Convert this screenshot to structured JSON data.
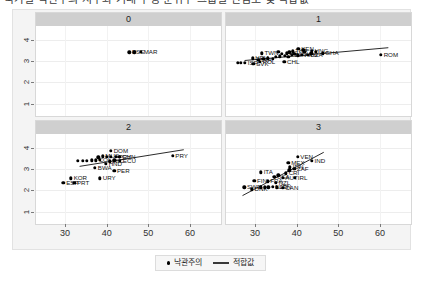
{
  "title": "국가별 낙관주의 지수와 기대 수명 분위수 그룹별 산점도 및 적합값",
  "legend": {
    "point_label": "낙관주의",
    "line_label": "적합값",
    "point_icon": "filled-circle-icon",
    "line_icon": "trend-line-icon"
  },
  "axes": {
    "xticks": [
      30,
      40,
      50,
      60
    ],
    "yticks": [
      1,
      2,
      3,
      4
    ],
    "xlim": [
      24,
      66
    ],
    "ylim": [
      0.7,
      4.45
    ],
    "xlabel": "",
    "ylabel": ""
  },
  "chart_data": {
    "type": "scatter",
    "title": "국가별 낙관주의 지수와 기대 수명 분위수 그룹별 산점도 및 적합값",
    "xlabel": "",
    "ylabel": "",
    "xlim": [
      24,
      66
    ],
    "ylim": [
      0.7,
      4.45
    ],
    "grid": true,
    "legend_position": "bottom",
    "facet_layout": "2x2",
    "facets": [
      {
        "strip": "0",
        "fit": {
          "x1": 0,
          "y1": 0,
          "x2": 0,
          "y2": 0,
          "visible": false
        },
        "points": [
          {
            "label": "PSE",
            "x": 45.4,
            "y": 3.4
          },
          {
            "label": "",
            "x": 46.6,
            "y": 3.4
          },
          {
            "label": "MAR",
            "x": 48.2,
            "y": 3.42
          }
        ]
      },
      {
        "strip": "1",
        "fit": {
          "x1": 27.5,
          "y1": 3.02,
          "x2": 62.0,
          "y2": 3.62,
          "visible": true
        },
        "points": [
          {
            "label": "TWN",
            "x": 31.6,
            "y": 3.35
          },
          {
            "label": "",
            "x": 25.8,
            "y": 2.9
          },
          {
            "label": "",
            "x": 26.6,
            "y": 2.9
          },
          {
            "label": "ISR",
            "x": 27.6,
            "y": 2.9
          },
          {
            "label": "SVK",
            "x": 29.6,
            "y": 2.86
          },
          {
            "label": "POL",
            "x": 31.2,
            "y": 2.95
          },
          {
            "label": "LVA",
            "x": 30.8,
            "y": 3.06
          },
          {
            "label": "HRV",
            "x": 29.4,
            "y": 3.13
          },
          {
            "label": "",
            "x": 32.0,
            "y": 3.1
          },
          {
            "label": "",
            "x": 33.1,
            "y": 3.12
          },
          {
            "label": "",
            "x": 34.2,
            "y": 3.11
          },
          {
            "label": "CHL",
            "x": 37.0,
            "y": 2.96
          },
          {
            "label": "",
            "x": 35.0,
            "y": 3.2
          },
          {
            "label": "",
            "x": 36.0,
            "y": 3.22
          },
          {
            "label": "",
            "x": 37.2,
            "y": 3.24
          },
          {
            "label": "",
            "x": 38.0,
            "y": 3.18
          },
          {
            "label": "BLR",
            "x": 38.8,
            "y": 3.3
          },
          {
            "label": "",
            "x": 36.4,
            "y": 3.34
          },
          {
            "label": "EGY",
            "x": 37.6,
            "y": 3.36
          },
          {
            "label": "",
            "x": 39.4,
            "y": 3.33
          },
          {
            "label": "",
            "x": 40.2,
            "y": 3.27
          },
          {
            "label": "ARG",
            "x": 41.2,
            "y": 3.3
          },
          {
            "label": "DZA",
            "x": 42.6,
            "y": 3.3
          },
          {
            "label": "",
            "x": 43.5,
            "y": 3.35
          },
          {
            "label": "",
            "x": 41.8,
            "y": 3.42
          },
          {
            "label": "THA",
            "x": 39.0,
            "y": 3.46
          },
          {
            "label": "KEN",
            "x": 40.4,
            "y": 3.56
          },
          {
            "label": "",
            "x": 41.6,
            "y": 3.52
          },
          {
            "label": "HNG",
            "x": 43.6,
            "y": 3.48
          },
          {
            "label": "",
            "x": 44.6,
            "y": 3.44
          },
          {
            "label": "GHA",
            "x": 46.2,
            "y": 3.36
          },
          {
            "label": "",
            "x": 38.2,
            "y": 3.4
          },
          {
            "label": "",
            "x": 35.6,
            "y": 3.42
          },
          {
            "label": "ROM",
            "x": 60.2,
            "y": 3.3
          }
        ]
      },
      {
        "strip": "2",
        "fit": {
          "x1": 33.5,
          "y1": 3.12,
          "x2": 58.5,
          "y2": 3.9,
          "visible": true
        },
        "points": [
          {
            "label": "ESP",
            "x": 29.6,
            "y": 2.36
          },
          {
            "label": "PRT",
            "x": 32.2,
            "y": 2.36
          },
          {
            "label": "KOR",
            "x": 31.4,
            "y": 2.56
          },
          {
            "label": "URY",
            "x": 38.4,
            "y": 2.56
          },
          {
            "label": "PER",
            "x": 41.8,
            "y": 2.92
          },
          {
            "label": "BWA",
            "x": 37.2,
            "y": 3.06
          },
          {
            "label": "",
            "x": 33.0,
            "y": 3.38
          },
          {
            "label": "",
            "x": 34.2,
            "y": 3.38
          },
          {
            "label": "",
            "x": 35.3,
            "y": 3.38
          },
          {
            "label": "",
            "x": 36.4,
            "y": 3.4
          },
          {
            "label": "COL",
            "x": 37.4,
            "y": 3.4
          },
          {
            "label": "",
            "x": 38.4,
            "y": 3.42
          },
          {
            "label": "HND",
            "x": 39.8,
            "y": 3.24
          },
          {
            "label": "NIC",
            "x": 40.8,
            "y": 3.36
          },
          {
            "label": "",
            "x": 41.8,
            "y": 3.4
          },
          {
            "label": "ECU",
            "x": 43.2,
            "y": 3.38
          },
          {
            "label": "",
            "x": 38.0,
            "y": 3.54
          },
          {
            "label": "MUS",
            "x": 39.0,
            "y": 3.6
          },
          {
            "label": "",
            "x": 40.0,
            "y": 3.58
          },
          {
            "label": "",
            "x": 41.0,
            "y": 3.56
          },
          {
            "label": "PRY",
            "x": 42.2,
            "y": 3.58
          },
          {
            "label": "CHN",
            "x": 43.0,
            "y": 3.58
          },
          {
            "label": "DOM",
            "x": 41.0,
            "y": 3.84
          },
          {
            "label": "PRY",
            "x": 55.8,
            "y": 3.62
          }
        ]
      },
      {
        "strip": "3",
        "fit": {
          "x1": 27.0,
          "y1": 1.75,
          "x2": 46.5,
          "y2": 3.78,
          "visible": true
        },
        "points": [
          {
            "label": "SWE",
            "x": 27.4,
            "y": 2.14
          },
          {
            "label": "DNK",
            "x": 29.2,
            "y": 2.04
          },
          {
            "label": "",
            "x": 31.4,
            "y": 2.14
          },
          {
            "label": "",
            "x": 32.3,
            "y": 2.14
          },
          {
            "label": "",
            "x": 33.2,
            "y": 2.14
          },
          {
            "label": "NLD",
            "x": 34.2,
            "y": 2.16
          },
          {
            "label": "JPN",
            "x": 35.2,
            "y": 2.14
          },
          {
            "label": "CAN",
            "x": 36.6,
            "y": 2.12
          },
          {
            "label": "FIN",
            "x": 29.8,
            "y": 2.44
          },
          {
            "label": "FRA",
            "x": 33.0,
            "y": 2.42
          },
          {
            "label": "NZL",
            "x": 35.0,
            "y": 2.34
          },
          {
            "label": "USA",
            "x": 34.6,
            "y": 2.62
          },
          {
            "label": "AUT",
            "x": 36.6,
            "y": 2.58
          },
          {
            "label": "IRL",
            "x": 39.6,
            "y": 2.58
          },
          {
            "label": "",
            "x": 35.6,
            "y": 2.7
          },
          {
            "label": "ITA",
            "x": 31.4,
            "y": 2.84
          },
          {
            "label": "CRI",
            "x": 37.4,
            "y": 2.8
          },
          {
            "label": "",
            "x": 38.2,
            "y": 2.94
          },
          {
            "label": "ZAF",
            "x": 39.4,
            "y": 3.0
          },
          {
            "label": "IDN",
            "x": 38.4,
            "y": 3.08
          },
          {
            "label": "MEX",
            "x": 38.0,
            "y": 3.3
          },
          {
            "label": "VEN",
            "x": 40.2,
            "y": 3.56
          },
          {
            "label": "IND",
            "x": 43.6,
            "y": 3.38
          }
        ]
      }
    ]
  }
}
